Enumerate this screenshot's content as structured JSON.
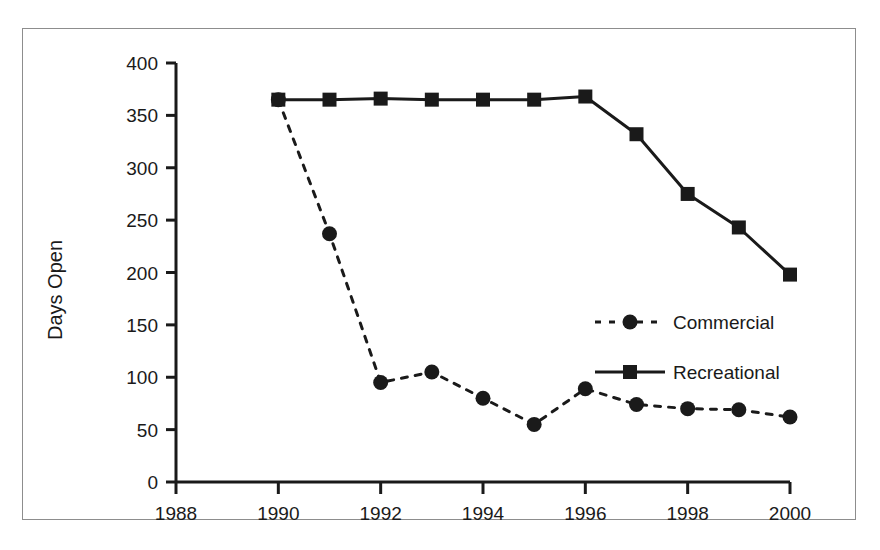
{
  "chart_data": {
    "type": "line",
    "title": "",
    "xlabel": "",
    "ylabel": "Days Open",
    "xlim": [
      1988,
      2000
    ],
    "ylim": [
      0,
      400
    ],
    "ytick_step": 50,
    "xtick_step": 2,
    "grid": false,
    "legend_position": "center-right",
    "x": [
      1990,
      1991,
      1992,
      1993,
      1994,
      1995,
      1996,
      1997,
      1998,
      1999,
      2000
    ],
    "xticks": [
      "1988",
      "1990",
      "1992",
      "1994",
      "1996",
      "1998",
      "2000"
    ],
    "xtick_values": [
      1988,
      1990,
      1992,
      1994,
      1996,
      1998,
      2000
    ],
    "yticks": [
      "0",
      "50",
      "100",
      "150",
      "200",
      "250",
      "300",
      "350",
      "400"
    ],
    "ytick_values": [
      0,
      50,
      100,
      150,
      200,
      250,
      300,
      350,
      400
    ],
    "series": [
      {
        "name": "Commercial",
        "marker": "circle",
        "linestyle": "dashed",
        "color": "#1a1a1a",
        "values": [
          365,
          237,
          95,
          105,
          80,
          55,
          89,
          74,
          70,
          69,
          62
        ]
      },
      {
        "name": "Recreational",
        "marker": "square",
        "linestyle": "solid",
        "color": "#1a1a1a",
        "values": [
          365,
          365,
          366,
          365,
          365,
          365,
          368,
          332,
          275,
          243,
          198
        ]
      }
    ]
  },
  "legend": {
    "entries": [
      {
        "label": "Commercial",
        "marker": "circle",
        "linestyle": "dashed"
      },
      {
        "label": "Recreational",
        "marker": "square",
        "linestyle": "solid"
      }
    ]
  },
  "colors": {
    "ink": "#1a1a1a",
    "frame": "#8d8d8d",
    "background": "#ffffff"
  }
}
